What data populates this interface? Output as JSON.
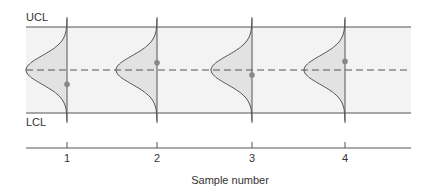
{
  "chart_data": {
    "type": "control-chart",
    "title": "",
    "xlabel": "Sample number",
    "ylabel": "",
    "limits": {
      "ucl_label": "UCL",
      "lcl_label": "LCL",
      "ucl": 3,
      "center": 0,
      "lcl": -3
    },
    "units": "standard deviations from center line",
    "categories": [
      "1",
      "2",
      "3",
      "4"
    ],
    "samples": [
      {
        "x": "1",
        "value": -1.0
      },
      {
        "x": "2",
        "value": 0.5
      },
      {
        "x": "3",
        "value": -0.35
      },
      {
        "x": "4",
        "value": 0.6
      }
    ],
    "distribution": "normal",
    "colors": {
      "band": "#f3f3f3",
      "curve_fill": "#e2e2e2",
      "line": "#555555",
      "point": "#888888"
    }
  }
}
